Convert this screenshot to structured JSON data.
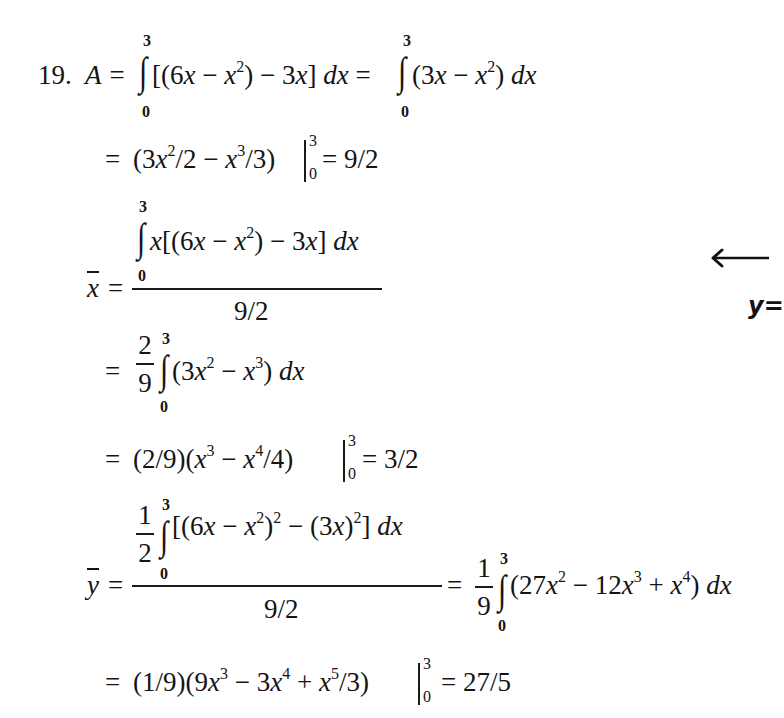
{
  "problem": {
    "number": "19.",
    "area": {
      "lhs": "A =",
      "int1": {
        "upper": "3",
        "lower": "0",
        "integrand_a": "[(6",
        "integrand_b": "x",
        "integrand_c": " − ",
        "integrand_d": "x",
        "integrand_e_sup": "2",
        "integrand_f": ") − 3",
        "integrand_g": "x",
        "integrand_h": "] ",
        "dx": "dx",
        "eq": " ="
      },
      "int2": {
        "upper": "3",
        "lower": "0",
        "a": "(3",
        "b": "x",
        "c": " − ",
        "d": "x",
        "sup": "2",
        "e": ") ",
        "dx": "dx"
      },
      "line2": {
        "eq": "=",
        "a": "(3",
        "b": "x",
        "sup1": "2",
        "c": "/2 − ",
        "d": "x",
        "sup2": "3",
        "e": "/3)",
        "upper": "3",
        "lower": "0",
        "result": "= 9/2"
      }
    },
    "xbar": {
      "symbol": "x",
      "eq": "=",
      "numerator": {
        "upper": "3",
        "lower": "0",
        "a": "x",
        "b": "[(6",
        "c": "x",
        "d": " − ",
        "e": "x",
        "sup": "2",
        "f": ") − 3",
        "g": "x",
        "h": "] ",
        "dx": "dx"
      },
      "denominator": "9/2",
      "step2": {
        "eq": "=",
        "frac_num": "2",
        "frac_den": "9",
        "upper": "3",
        "lower": "0",
        "a": "(3",
        "b": "x",
        "sup1": "2",
        "c": " − ",
        "d": "x",
        "sup2": "3",
        "e": ") ",
        "dx": "dx"
      },
      "step3": {
        "eq": "=",
        "a": "(2/9)(",
        "b": "x",
        "sup1": "3",
        "c": " − ",
        "d": "x",
        "sup2": "4",
        "e": "/4)",
        "upper": "3",
        "lower": "0",
        "result": "= 3/2"
      }
    },
    "ybar": {
      "symbol": "y",
      "eq": "=",
      "numerator": {
        "frac_num": "1",
        "frac_den": "2",
        "upper": "3",
        "lower": "0",
        "a": "[(6",
        "b": "x",
        "c": " − ",
        "d": "x",
        "sup1": "2",
        "e": ")",
        "sup2": "2",
        "f": " − (3",
        "g": "x",
        "h": ")",
        "sup3": "2",
        "i": "] ",
        "dx": "dx"
      },
      "denominator": "9/2",
      "rhs": {
        "eq": "=",
        "frac_num": "1",
        "frac_den": "9",
        "upper": "3",
        "lower": "0",
        "a": "(27",
        "b": "x",
        "sup1": "2",
        "c": " − 12",
        "d": "x",
        "sup2": "3",
        "e": " + ",
        "f": "x",
        "sup3": "4",
        "g": ") ",
        "dx": "dx"
      },
      "step3": {
        "eq": "=",
        "a": "(1/9)(9",
        "b": "x",
        "sup1": "3",
        "c": " − 3",
        "d": "x",
        "sup2": "4",
        "e": " + ",
        "f": "x",
        "sup3": "5",
        "g": "/3)",
        "upper": "3",
        "lower": "0",
        "result": "= 27/5"
      }
    }
  },
  "annotation": {
    "arrow": "←",
    "label": "y="
  }
}
